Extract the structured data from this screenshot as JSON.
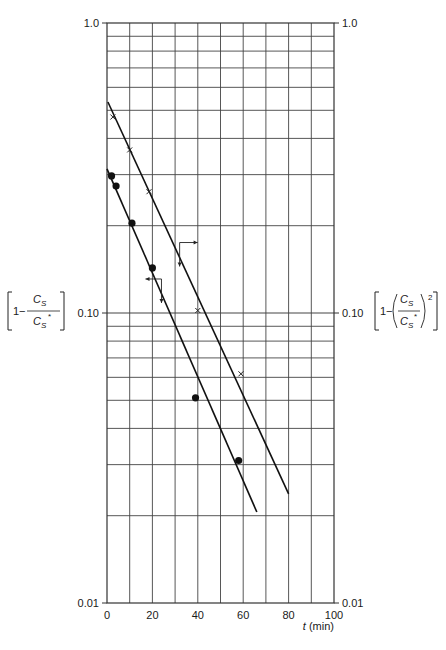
{
  "chart_data": {
    "type": "scatter",
    "title": "",
    "xlabel": "t (min)",
    "xlabel_parts": {
      "var": "t",
      "unit": " (min)"
    },
    "ylabel_left": "[1 − Cs/Cs*]",
    "ylabel_right": "[1 − (Cs/Cs*)²]",
    "yscale": "log",
    "xlim": [
      0,
      100
    ],
    "ylim": [
      0.01,
      1.0
    ],
    "grid": true,
    "x_ticks": [
      0,
      20,
      40,
      60,
      80,
      100
    ],
    "x_tick_labels": [
      "0",
      "20",
      "40",
      "60",
      "80",
      "100"
    ],
    "x_grid_step": 10,
    "y_tick_labels_left": [
      {
        "value": 1.0,
        "label": "1.0"
      },
      {
        "value": 0.1,
        "label": "0.10"
      },
      {
        "value": 0.01,
        "label": "0.01"
      }
    ],
    "y_tick_labels_right": [
      {
        "value": 1.0,
        "label": "1.0"
      },
      {
        "value": 0.1,
        "label": "0.10"
      },
      {
        "value": 0.01,
        "label": "0.01"
      }
    ],
    "series": [
      {
        "name": "1 - Cs/Cs* (left axis)",
        "marker": "filled-circle",
        "points": [
          {
            "t": 2,
            "y": 0.297
          },
          {
            "t": 4,
            "y": 0.274
          },
          {
            "t": 11,
            "y": 0.204
          },
          {
            "t": 20,
            "y": 0.143
          },
          {
            "t": 39,
            "y": 0.051
          },
          {
            "t": 58,
            "y": 0.031
          }
        ],
        "fit_line": {
          "t0": 0,
          "y0": 0.314,
          "t1": 66,
          "y1": 0.0206
        }
      },
      {
        "name": "1 - (Cs/Cs*)^2 (right axis)",
        "marker": "cross",
        "points": [
          {
            "t": 2.6,
            "y": 0.474
          },
          {
            "t": 10,
            "y": 0.365
          },
          {
            "t": 18.5,
            "y": 0.262
          },
          {
            "t": 40,
            "y": 0.102
          },
          {
            "t": 59,
            "y": 0.0617
          }
        ],
        "fit_line": {
          "t0": 0.4,
          "y0": 0.534,
          "t1": 80,
          "y1": 0.0238
        }
      }
    ],
    "annotations": [
      {
        "type": "axis-arrow",
        "series": 1,
        "at_t": 32,
        "at_y": 0.175,
        "horizontal": "right",
        "vertical": "down"
      },
      {
        "type": "axis-arrow",
        "series": 0,
        "at_t": 24,
        "at_y": 0.131,
        "horizontal": "left",
        "vertical": "down"
      }
    ]
  },
  "labels": {
    "left_axis": {
      "prefix": "1−",
      "num": "C",
      "num_sub": "S",
      "den": "C",
      "den_sub": "S",
      "den_sup": "*"
    },
    "right_axis": {
      "prefix": "1−",
      "num": "C",
      "num_sub": "S",
      "den": "C",
      "den_sub": "S",
      "den_sup": "*",
      "power": "2"
    }
  }
}
